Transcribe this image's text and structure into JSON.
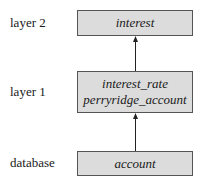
{
  "diagram": {
    "layers": [
      {
        "label": "layer 2",
        "items": [
          "interest"
        ]
      },
      {
        "label": "layer 1",
        "items": [
          "interest_rate",
          "perryridge_account"
        ]
      },
      {
        "label": "database",
        "items": [
          "account"
        ]
      }
    ],
    "edges": [
      {
        "from": "database",
        "to": "layer 1"
      },
      {
        "from": "layer 1",
        "to": "layer 2"
      }
    ],
    "colors": {
      "box_fill": "#dcdcdc",
      "box_border": "#555555",
      "arrow": "#222222"
    }
  }
}
